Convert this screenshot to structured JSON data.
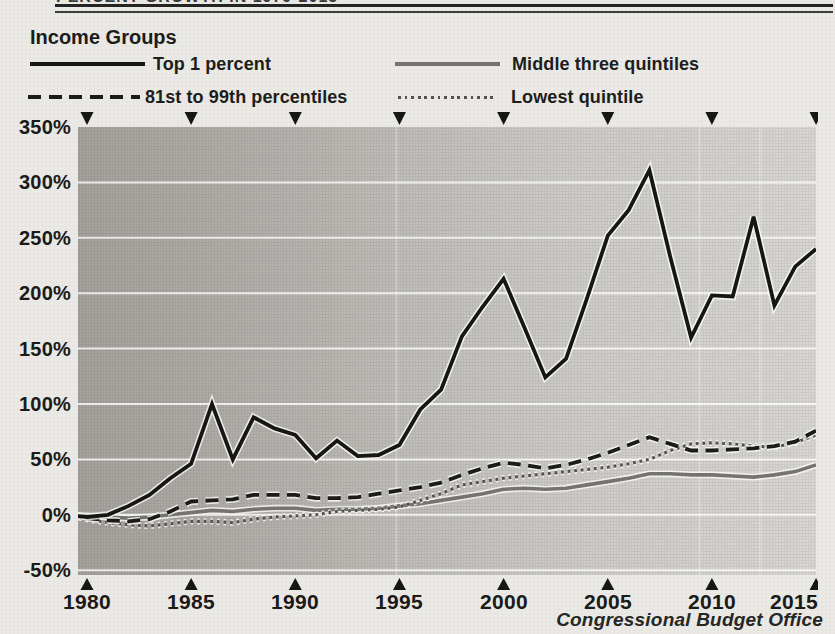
{
  "page": {
    "clipped_heading": "PERCENT GROWTH IN 1979-2015",
    "attribution": "Congressional Budget Office",
    "background": "#eae9e5"
  },
  "legend": {
    "title": "Income Groups",
    "items": [
      {
        "label": "Top 1 percent",
        "style": "solid-black"
      },
      {
        "label": "81st to 99th percentiles",
        "style": "dashed-black"
      },
      {
        "label": "Middle three quintiles",
        "style": "solid-gray"
      },
      {
        "label": "Lowest quintile",
        "style": "dotted-gray"
      }
    ]
  },
  "chart_data": {
    "type": "line",
    "title": "Income Groups",
    "xlabel": "",
    "ylabel": "",
    "xlim": [
      1979,
      2015
    ],
    "ylim": [
      -50,
      350
    ],
    "grid": "horizontal-white",
    "legend_position": "top-left",
    "grid_color": "#ffffff",
    "marker_color": "#161614",
    "plot_gradient": [
      "#a5a29e",
      "#b2afab",
      "#c3c1bd",
      "#d0ceca",
      "#dad8d4"
    ],
    "years": [
      1979,
      1980,
      1981,
      1982,
      1983,
      1984,
      1985,
      1986,
      1987,
      1988,
      1989,
      1990,
      1991,
      1992,
      1993,
      1994,
      1995,
      1996,
      1997,
      1998,
      1999,
      2000,
      2001,
      2002,
      2003,
      2004,
      2005,
      2006,
      2007,
      2008,
      2009,
      2010,
      2011,
      2012,
      2013,
      2014,
      2015
    ],
    "series": [
      {
        "key": "top-1-percent",
        "name": "Top 1 percent",
        "line": "solid",
        "color": "#161614",
        "width": 3.8,
        "values": [
          0,
          -2,
          0,
          8,
          18,
          33,
          46,
          100,
          50,
          88,
          78,
          72,
          51,
          67,
          53,
          54,
          63,
          95,
          113,
          161,
          188,
          213,
          169,
          124,
          141,
          195,
          252,
          275,
          311,
          233,
          160,
          198,
          197,
          269,
          189,
          224,
          240
        ]
      },
      {
        "key": "81st-to-99th-percentiles",
        "name": "81st to 99th percentiles",
        "line": "dashed",
        "color": "#1b1b19",
        "width": 3.8,
        "values": [
          0,
          -3,
          -5,
          -6,
          -4,
          3,
          12,
          13,
          14,
          18,
          18,
          18,
          15,
          15,
          16,
          19,
          22,
          25,
          29,
          36,
          42,
          47,
          45,
          42,
          45,
          50,
          56,
          63,
          70,
          64,
          58,
          58,
          59,
          60,
          62,
          66,
          76
        ]
      },
      {
        "key": "middle-three-quintiles",
        "name": "Middle three quintiles",
        "line": "solid",
        "color": "#757470",
        "width": 3.6,
        "values": [
          0,
          -1,
          -2,
          -3,
          -2,
          0,
          2,
          4,
          3,
          5,
          6,
          6,
          4,
          5,
          5,
          6,
          8,
          10,
          13,
          16,
          19,
          23,
          24,
          23,
          24,
          27,
          30,
          33,
          37,
          37,
          36,
          36,
          35,
          34,
          36,
          39,
          45
        ]
      },
      {
        "key": "lowest-quintile",
        "name": "Lowest quintile",
        "line": "dotted",
        "color": "#555450",
        "width": 3.2,
        "values": [
          0,
          -4,
          -7,
          -9,
          -10,
          -8,
          -6,
          -6,
          -7,
          -4,
          -2,
          -1,
          0,
          3,
          4,
          5,
          7,
          13,
          19,
          27,
          30,
          33,
          35,
          37,
          39,
          41,
          43,
          46,
          50,
          58,
          64,
          65,
          64,
          62,
          61,
          65,
          72
        ]
      }
    ],
    "y_ticks": [
      {
        "value": 350,
        "label": "350%"
      },
      {
        "value": 300,
        "label": "300%"
      },
      {
        "value": 250,
        "label": "250%"
      },
      {
        "value": 200,
        "label": "200%"
      },
      {
        "value": 150,
        "label": "150%"
      },
      {
        "value": 100,
        "label": "100%"
      },
      {
        "value": 50,
        "label": "50%"
      },
      {
        "value": 0,
        "label": "0%"
      },
      {
        "value": -50,
        "label": "-50%"
      }
    ],
    "x_ticks": [
      {
        "year": 1980,
        "label": "1980"
      },
      {
        "year": 1985,
        "label": "1985"
      },
      {
        "year": 1990,
        "label": "1990"
      },
      {
        "year": 1995,
        "label": "1995"
      },
      {
        "year": 2000,
        "label": "2000"
      },
      {
        "year": 2005,
        "label": "2005"
      },
      {
        "year": 2010,
        "label": "2010"
      },
      {
        "year": 2015,
        "label": "2015"
      }
    ],
    "gridlines": [
      300,
      250,
      200,
      150,
      100,
      50,
      0,
      -50
    ]
  }
}
